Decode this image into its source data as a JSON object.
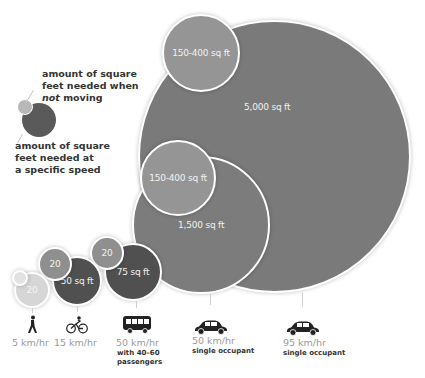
{
  "legend": {
    "not_moving_line1": "amount of square",
    "not_moving_line2": "feet needed when",
    "not_moving_line3_italic": "not",
    "not_moving_line3_rest": " moving",
    "speed_line1": "amount of square",
    "speed_line2": "feet needed at",
    "speed_line3": "a specific speed"
  },
  "circles": {
    "car95_moving": "5,000 sq ft",
    "car95_parked": "150-400 sq ft",
    "car50_moving": "1,500 sq ft",
    "car50_parked": "150-400 sq ft",
    "bus_moving": "75 sq ft",
    "bus_parked": "20",
    "bike_moving": "50 sq ft",
    "bike_parked": "20",
    "walk_moving": "20",
    "walk_parked": ""
  },
  "modes": [
    {
      "icon": "pedestrian-icon",
      "speed": "5 km/hr",
      "detail": ""
    },
    {
      "icon": "cyclist-icon",
      "speed": "15 km/hr",
      "detail": ""
    },
    {
      "icon": "bus-icon",
      "speed": "50 km/hr",
      "detail_line1": "with 40–60",
      "detail_line2": "passengers"
    },
    {
      "icon": "car-icon",
      "speed": "50 km/hr",
      "detail_line1": "single occupant"
    },
    {
      "icon": "car-icon",
      "speed": "95 km/hr",
      "detail_line1": "single occupant"
    }
  ],
  "colors": {
    "large_circle": "#7a7a7a",
    "parked_circle": "#959595",
    "dark_circle": "#505050",
    "pale_circle": "#d6d6d6",
    "speed_label": "#9a9a9a"
  }
}
